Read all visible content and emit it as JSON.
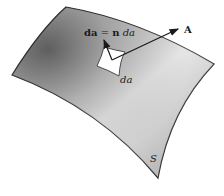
{
  "diagram": {
    "surface_label": "S",
    "area_vector_label_bold": "da",
    "area_vector_eq": " = ",
    "area_vector_n": "n",
    "area_vector_da": " da",
    "patch_label": "da",
    "field_label": "A",
    "colors": {
      "outline": "#2a2a2a",
      "surface_dark": "#6e6e6e",
      "surface_light": "#e6e6e6",
      "patch": "#ffffff",
      "background": "#ffffff"
    }
  }
}
